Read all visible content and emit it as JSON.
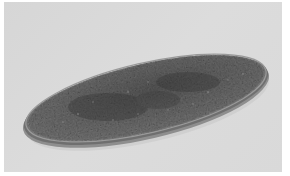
{
  "image": {
    "subject": "oval speckled dish",
    "alt": "Grayscale photograph of a shallow oval dish with a speckled granite-like surface on a light gray background",
    "colors": {
      "background": "#d9d9d9",
      "frame": "#ffffff",
      "dish_dark": "#4a4a4a",
      "dish_mid": "#6e6e6e",
      "dish_rim": "#8a8a8a"
    }
  }
}
